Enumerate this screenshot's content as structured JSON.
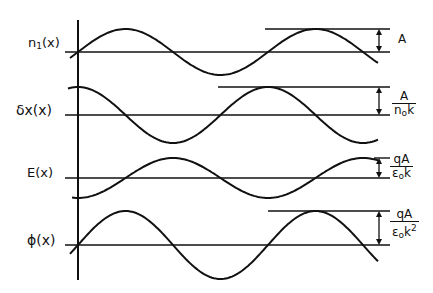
{
  "diagram": {
    "type": "wave-phase-relations",
    "axis": {
      "x": 78,
      "top": 20,
      "bottom": 280
    },
    "line_color": "#111111",
    "background": "#ffffff",
    "period_px": 190,
    "rows": [
      {
        "id": "n1",
        "label": "n₁(x)",
        "label_main": "n",
        "label_sub": "1",
        "label_tail": "(x)",
        "baseline_y": 52,
        "amplitude_px": 23,
        "phase": "sin",
        "scale_label": {
          "num": "A",
          "den": ""
        }
      },
      {
        "id": "dx",
        "label": "δx(x)",
        "label_main": "δx(x)",
        "baseline_y": 115,
        "amplitude_px": 28,
        "phase": "cos",
        "scale_label": {
          "num": "A",
          "den_main": "n",
          "den_sub": "o",
          "den_tail": "k"
        }
      },
      {
        "id": "E",
        "label": "E(x)",
        "label_main": "E(x)",
        "baseline_y": 178,
        "amplitude_px": 20,
        "phase": "-cos",
        "scale_label": {
          "num": "qA",
          "den_main": "ε",
          "den_sub": "o",
          "den_tail": "k"
        }
      },
      {
        "id": "phi",
        "label": "ϕ(x)",
        "label_main": "ϕ(x)",
        "baseline_y": 245,
        "amplitude_px": 34,
        "phase": "sin",
        "scale_label": {
          "num": "qA",
          "den_main": "ε",
          "den_sub": "o",
          "den_tail": "k",
          "den_sup": "2"
        }
      }
    ]
  }
}
